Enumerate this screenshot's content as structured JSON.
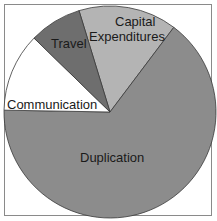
{
  "chart_data": {
    "type": "pie",
    "title": "",
    "categories": [
      "Capital Expenditures",
      "Duplication",
      "Communication",
      "Travel"
    ],
    "values": [
      15,
      65,
      12,
      8
    ],
    "unit": "%",
    "colors": [
      "#b4b4b4",
      "#8c8c8c",
      "#ffffff",
      "#6e6e6e"
    ],
    "start_angle_deg": 343,
    "direction": "clockwise",
    "legend": "none",
    "labels_inside": true
  },
  "labels": {
    "capital_line1": "Capital",
    "capital_line2": "Expenditures",
    "travel": "Travel",
    "communication": "Communication",
    "duplication": "Duplication"
  }
}
